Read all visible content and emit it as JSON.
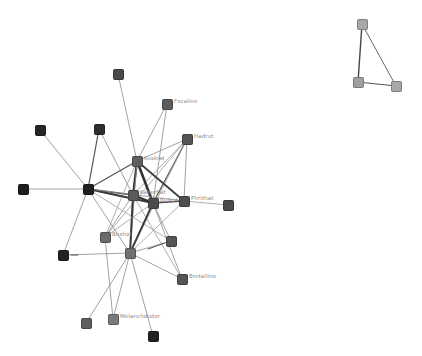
{
  "graph": {
    "nodes": [
      {
        "id": "n1",
        "x": 118,
        "y": 74,
        "color": "#4a4a4a",
        "label": ""
      },
      {
        "id": "n2",
        "x": 167,
        "y": 104,
        "color": "#5c5c5c",
        "label": "Fxcaline"
      },
      {
        "id": "n3",
        "x": 40,
        "y": 130,
        "color": "#262626",
        "label": ""
      },
      {
        "id": "n4",
        "x": 99,
        "y": 129,
        "color": "#2e2e2e",
        "label": ""
      },
      {
        "id": "n5",
        "x": 187,
        "y": 139,
        "color": "#555555",
        "label": "Hadrut"
      },
      {
        "id": "n6",
        "x": 137,
        "y": 161,
        "color": "#5e5e5e",
        "label": "Kuskiat"
      },
      {
        "id": "n7",
        "x": 23,
        "y": 189,
        "color": "#1e1e1e",
        "label": ""
      },
      {
        "id": "n8",
        "x": 88,
        "y": 189,
        "color": "#202020",
        "label": ""
      },
      {
        "id": "n9",
        "x": 133,
        "y": 195,
        "color": "#5a5a5a",
        "label": "Kaberbat"
      },
      {
        "id": "n10",
        "x": 153,
        "y": 203,
        "color": "#4c4c4c",
        "label": "Bulkot"
      },
      {
        "id": "n11",
        "x": 184,
        "y": 201,
        "color": "#4e4e4e",
        "label": "Phrithat"
      },
      {
        "id": "n12",
        "x": 228,
        "y": 205,
        "color": "#4a4a4a",
        "label": ""
      },
      {
        "id": "n13",
        "x": 105,
        "y": 237,
        "color": "#6a6a6a",
        "label": "Bushot"
      },
      {
        "id": "n14",
        "x": 171,
        "y": 241,
        "color": "#555555",
        "label": ""
      },
      {
        "id": "n15",
        "x": 63,
        "y": 255,
        "color": "#222222",
        "label": ""
      },
      {
        "id": "n16",
        "x": 130,
        "y": 253,
        "color": "#707070",
        "label": ""
      },
      {
        "id": "n17",
        "x": 182,
        "y": 279,
        "color": "#555555",
        "label": "Bretalline"
      },
      {
        "id": "n18",
        "x": 86,
        "y": 323,
        "color": "#5e5e5e",
        "label": ""
      },
      {
        "id": "n19",
        "x": 113,
        "y": 319,
        "color": "#7a7a7a",
        "label": "Melanchdistor"
      },
      {
        "id": "n20",
        "x": 153,
        "y": 336,
        "color": "#222222",
        "label": ""
      },
      {
        "id": "t1",
        "x": 362,
        "y": 24,
        "color": "#a8a8a8",
        "label": ""
      },
      {
        "id": "t2",
        "x": 358,
        "y": 82,
        "color": "#a0a0a0",
        "label": ""
      },
      {
        "id": "t3",
        "x": 396,
        "y": 86,
        "color": "#a8a8a8",
        "label": ""
      }
    ],
    "edges": [
      {
        "s": "n1",
        "t": "n6",
        "w": 0.8,
        "c": "#8a8a8a"
      },
      {
        "s": "n2",
        "t": "n6",
        "w": 0.8,
        "c": "#8a8a8a"
      },
      {
        "s": "n2",
        "t": "n10",
        "w": 0.8,
        "c": "#8a8a8a"
      },
      {
        "s": "n3",
        "t": "n8",
        "w": 0.8,
        "c": "#8a8a8a"
      },
      {
        "s": "n4",
        "t": "n8",
        "w": 1.2,
        "c": "#555555"
      },
      {
        "s": "n4",
        "t": "n9",
        "w": 0.8,
        "c": "#8a8a8a"
      },
      {
        "s": "n5",
        "t": "n6",
        "w": 0.8,
        "c": "#8a8a8a"
      },
      {
        "s": "n5",
        "t": "n9",
        "w": 0.8,
        "c": "#9a9a9a"
      },
      {
        "s": "n5",
        "t": "n10",
        "w": 1.2,
        "c": "#555555"
      },
      {
        "s": "n5",
        "t": "n11",
        "w": 0.8,
        "c": "#8a8a8a"
      },
      {
        "s": "n5",
        "t": "n13",
        "w": 0.8,
        "c": "#9a9a9a"
      },
      {
        "s": "n5",
        "t": "n16",
        "w": 0.8,
        "c": "#9a9a9a"
      },
      {
        "s": "n6",
        "t": "n8",
        "w": 1.2,
        "c": "#555555"
      },
      {
        "s": "n6",
        "t": "n9",
        "w": 2.2,
        "c": "#3a3a3a"
      },
      {
        "s": "n6",
        "t": "n10",
        "w": 2.6,
        "c": "#333333"
      },
      {
        "s": "n6",
        "t": "n11",
        "w": 1.8,
        "c": "#3f3f3f"
      },
      {
        "s": "n6",
        "t": "n13",
        "w": 0.8,
        "c": "#9a9a9a"
      },
      {
        "s": "n6",
        "t": "n16",
        "w": 0.8,
        "c": "#8a8a8a"
      },
      {
        "s": "n7",
        "t": "n8",
        "w": 0.8,
        "c": "#8a8a8a"
      },
      {
        "s": "n8",
        "t": "n9",
        "w": 1.4,
        "c": "#4a4a4a"
      },
      {
        "s": "n8",
        "t": "n10",
        "w": 2.0,
        "c": "#3a3a3a"
      },
      {
        "s": "n8",
        "t": "n11",
        "w": 0.8,
        "c": "#8a8a8a"
      },
      {
        "s": "n8",
        "t": "n15",
        "w": 0.8,
        "c": "#8a8a8a"
      },
      {
        "s": "n8",
        "t": "n16",
        "w": 0.8,
        "c": "#8a8a8a"
      },
      {
        "s": "n8",
        "t": "n14",
        "w": 0.8,
        "c": "#9a9a9a"
      },
      {
        "s": "n9",
        "t": "n10",
        "w": 2.4,
        "c": "#333333"
      },
      {
        "s": "n9",
        "t": "n16",
        "w": 2.0,
        "c": "#3a3a3a"
      },
      {
        "s": "n9",
        "t": "n13",
        "w": 0.8,
        "c": "#8a8a8a"
      },
      {
        "s": "n9",
        "t": "n17",
        "w": 0.8,
        "c": "#9a9a9a"
      },
      {
        "s": "n10",
        "t": "n11",
        "w": 1.4,
        "c": "#4a4a4a"
      },
      {
        "s": "n10",
        "t": "n16",
        "w": 1.8,
        "c": "#3a3a3a"
      },
      {
        "s": "n10",
        "t": "n14",
        "w": 0.8,
        "c": "#8a8a8a"
      },
      {
        "s": "n10",
        "t": "n17",
        "w": 0.8,
        "c": "#8a8a8a"
      },
      {
        "s": "n10",
        "t": "n13",
        "w": 0.8,
        "c": "#9a9a9a"
      },
      {
        "s": "n11",
        "t": "n12",
        "w": 0.8,
        "c": "#9a9a9a"
      },
      {
        "s": "n11",
        "t": "n16",
        "w": 0.8,
        "c": "#9a9a9a"
      },
      {
        "s": "n13",
        "t": "n19",
        "w": 0.8,
        "c": "#8a8a8a"
      },
      {
        "s": "n14",
        "t": "n16",
        "w": 0.8,
        "c": "#8a8a8a"
      },
      {
        "s": "n14",
        "t": "n16b",
        "w": 1.0,
        "c": "#555555"
      },
      {
        "s": "n15",
        "t": "n16",
        "w": 0.8,
        "c": "#8a8a8a"
      },
      {
        "s": "n16",
        "t": "n17",
        "w": 0.8,
        "c": "#8a8a8a"
      },
      {
        "s": "n16",
        "t": "n18",
        "w": 0.8,
        "c": "#8a8a8a"
      },
      {
        "s": "n16",
        "t": "n19",
        "w": 0.8,
        "c": "#8a8a8a"
      },
      {
        "s": "n16",
        "t": "n20",
        "w": 0.8,
        "c": "#8a8a8a"
      },
      {
        "s": "t1",
        "t": "t2",
        "w": 1.4,
        "c": "#444444"
      },
      {
        "s": "t1",
        "t": "t3",
        "w": 1.0,
        "c": "#666666"
      },
      {
        "s": "t2",
        "t": "t3",
        "w": 1.2,
        "c": "#555555"
      }
    ],
    "stubs": [
      {
        "x1": 148,
        "y1": 249,
        "x2": 165,
        "y2": 243,
        "w": 1.0,
        "c": "#555555"
      },
      {
        "x1": 71,
        "y1": 255,
        "x2": 78,
        "y2": 255,
        "w": 1.0,
        "c": "#555555"
      }
    ]
  }
}
